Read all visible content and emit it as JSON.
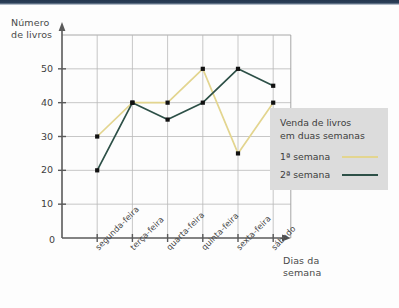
{
  "chart_data": {
    "type": "line",
    "title": "Venda de livros em duas semanas",
    "xlabel": "Dias da semana",
    "ylabel": "Número de livros",
    "categories": [
      "segunda-feira",
      "terça-feira",
      "quarta-feira",
      "quinta-feira",
      "sexta-feira",
      "sábado"
    ],
    "yticks": [
      10,
      20,
      30,
      40,
      50
    ],
    "ylim": [
      0,
      60
    ],
    "origin_label": "0",
    "grid": true,
    "legend_position": "right",
    "series": [
      {
        "name": "1ª semana",
        "color": "#e3d58f",
        "values": [
          30,
          40,
          40,
          50,
          25,
          40
        ]
      },
      {
        "name": "2ª semana",
        "color": "#2d5047",
        "values": [
          20,
          40,
          35,
          40,
          50,
          45
        ]
      }
    ]
  },
  "legend": {
    "title": "Venda de livros\nem duas semanas",
    "entries": [
      {
        "label": "1ª semana"
      },
      {
        "label": "2ª semana"
      }
    ]
  },
  "axes": {
    "y_title": "Número\nde livros",
    "x_title": "Dias da\nsemana"
  }
}
